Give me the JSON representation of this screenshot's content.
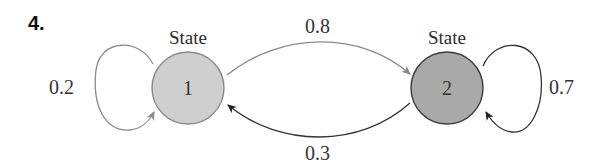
{
  "problem_number": "4.",
  "states": [
    {
      "title": "State",
      "label": "1",
      "fill": "#cfcfcf",
      "stroke": "#8a8a8a"
    },
    {
      "title": "State",
      "label": "2",
      "fill": "#a9a9a9",
      "stroke": "#3a3a3a"
    }
  ],
  "transitions": [
    {
      "from": "1",
      "to": "1",
      "probability": "0.2",
      "color": "#8a8a8a"
    },
    {
      "from": "1",
      "to": "2",
      "probability": "0.8",
      "color": "#8a8a8a"
    },
    {
      "from": "2",
      "to": "1",
      "probability": "0.3",
      "color": "#333333"
    },
    {
      "from": "2",
      "to": "2",
      "probability": "0.7",
      "color": "#333333"
    }
  ]
}
